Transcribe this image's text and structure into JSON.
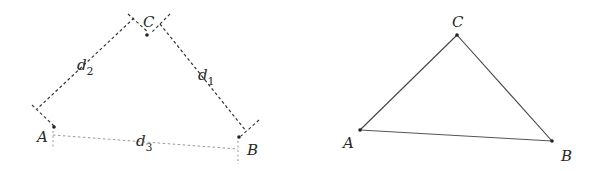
{
  "left_figure": {
    "description": "Triangle with distances measured as dashed lines",
    "points": {
      "A": {
        "label": "A",
        "x": 54,
        "y": 127
      },
      "B": {
        "label": "B",
        "x": 240,
        "y": 137
      },
      "C": {
        "label": "C",
        "x": 147,
        "y": 35
      }
    },
    "distance_labels": {
      "d1": {
        "base": "d",
        "sub": "1"
      },
      "d2": {
        "base": "d",
        "sub": "2"
      },
      "d3": {
        "base": "d",
        "sub": "3"
      }
    }
  },
  "right_figure": {
    "description": "Triangle ABC with solid edges",
    "points": {
      "A": {
        "label": "A",
        "x": 360,
        "y": 130
      },
      "B": {
        "label": "B",
        "x": 552,
        "y": 141
      },
      "C": {
        "label": "C",
        "x": 457,
        "y": 35
      }
    }
  },
  "colors": {
    "stroke_dark": "#333333",
    "stroke_light": "#9a9a9a",
    "text": "#2a2a2a",
    "background": "#ffffff"
  }
}
